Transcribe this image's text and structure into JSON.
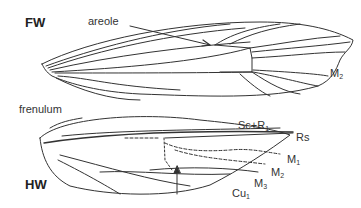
{
  "diagram": {
    "type": "insect wing venation (Lepidoptera)",
    "forewing": {
      "label": "FW",
      "annotations": [
        {
          "text": "areole",
          "pointer": "arrow"
        },
        {
          "text": "M",
          "subscript": "2"
        }
      ]
    },
    "hindwing": {
      "label": "HW",
      "annotations": [
        {
          "text": "frenulum"
        },
        {
          "text": "Sc+R",
          "subscript": "1"
        },
        {
          "text": "Rs",
          "subscript": ""
        },
        {
          "text": "M",
          "subscript": "1"
        },
        {
          "text": "M",
          "subscript": "2"
        },
        {
          "text": "M",
          "subscript": "3"
        },
        {
          "text": "Cu",
          "subscript": "1"
        }
      ],
      "pointer": "upward arrow to cell"
    },
    "colors": {
      "line": "#333333",
      "text": "#333333",
      "background": "#ffffff"
    }
  }
}
